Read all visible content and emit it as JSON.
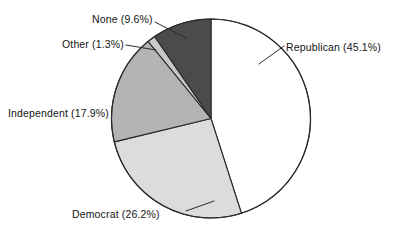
{
  "chart_data": {
    "type": "pie",
    "title": "",
    "subtitle": "",
    "xlabel": "",
    "ylabel": "",
    "legend_position": "none",
    "grid": false,
    "label_format": "{name} ({value}%)",
    "start_angle_deg": 0,
    "direction": "clockwise",
    "categories": [
      "Republican",
      "Democrat",
      "Independent",
      "Other",
      "None"
    ],
    "values": [
      45.1,
      26.2,
      17.9,
      1.3,
      9.6
    ],
    "units": "percent",
    "colors": [
      "#ffffff",
      "#dcdcdc",
      "#b4b4b4",
      "#c9c9c9",
      "#4b4b4b"
    ],
    "edge_color": "#2b2b2b",
    "slices": [
      {
        "name": "Republican",
        "value": 45.1,
        "label": "Republican (45.1%)",
        "color": "#ffffff",
        "leader_line": true
      },
      {
        "name": "Democrat",
        "value": 26.2,
        "label": "Democrat (26.2%)",
        "color": "#dcdcdc",
        "leader_line": true
      },
      {
        "name": "Independent",
        "value": 17.9,
        "label": "Independent (17.9%)",
        "color": "#b4b4b4",
        "leader_line": false
      },
      {
        "name": "Other",
        "value": 1.3,
        "label": "Other (1.3%)",
        "color": "#c9c9c9",
        "leader_line": true
      },
      {
        "name": "None",
        "value": 9.6,
        "label": "None (9.6%)",
        "color": "#4b4b4b",
        "leader_line": true
      }
    ]
  },
  "labels": {
    "republican": "Republican (45.1%)",
    "democrat": "Democrat (26.2%)",
    "independent": "Independent (17.9%)",
    "other": "Other (1.3%)",
    "none": "None (9.6%)"
  }
}
